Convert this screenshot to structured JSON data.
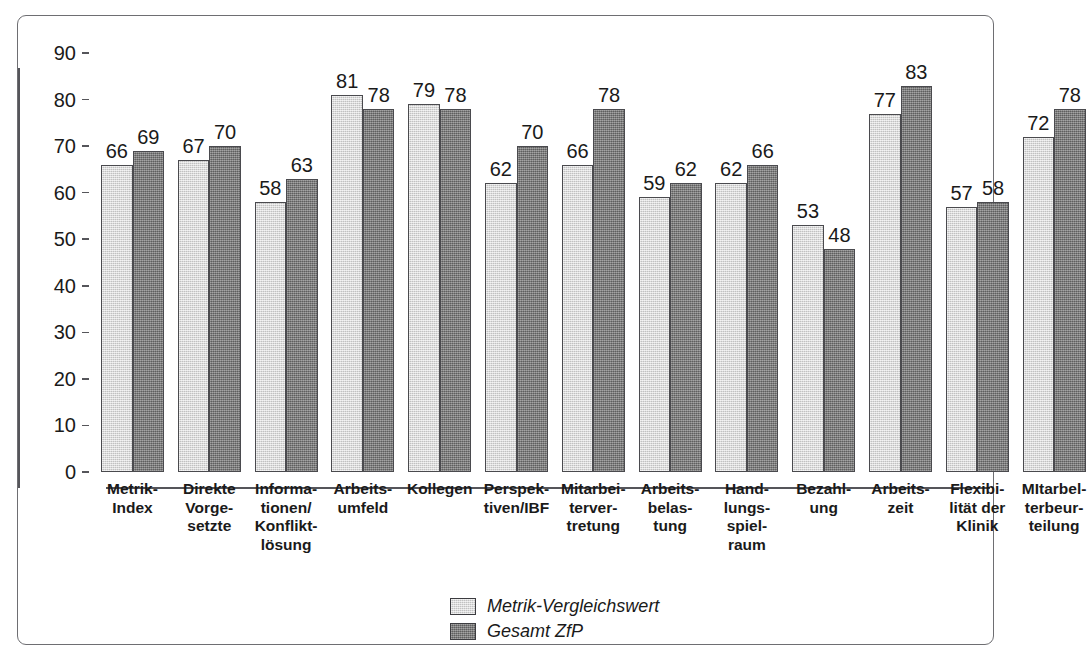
{
  "chart_data": {
    "type": "bar",
    "title": "",
    "xlabel": "",
    "ylabel": "",
    "ylim": [
      0,
      90
    ],
    "yticks": [
      0,
      10,
      20,
      30,
      40,
      50,
      60,
      70,
      80,
      90
    ],
    "grid": false,
    "legend_position": "bottom-center",
    "categories": [
      "Metrik-\nIndex",
      "Direkte\nVorge-\nsetzte",
      "Informa-\ntionen/\nKonflikt-\nlösung",
      "Arbeits-\numfeld",
      "Kollegen",
      "Perspek-\ntiven/IBF",
      "Mitarbei-\nterver-\ntretung",
      "Arbeits-\nbelas-\ntung",
      "Hand-\nlungs-\nspiel-\nraum",
      "Bezahl-\nung",
      "Arbeits-\nzeit",
      "Flexibi-\nlität der\nKlinik",
      "MItarbel-\nterbeur-\nteilung"
    ],
    "series": [
      {
        "name": "Metrik-Vergleichswert",
        "color": "#d2d2d2",
        "values": [
          66,
          67,
          58,
          81,
          79,
          62,
          66,
          59,
          62,
          53,
          77,
          57,
          72
        ]
      },
      {
        "name": "Gesamt ZfP",
        "color": "#7e7e7e",
        "values": [
          69,
          70,
          63,
          78,
          78,
          70,
          78,
          62,
          66,
          48,
          83,
          58,
          78
        ]
      }
    ]
  },
  "legend": {
    "items": [
      {
        "label": "Metrik-Vergleichswert",
        "swatch": "light"
      },
      {
        "label": "Gesamt ZfP",
        "swatch": "dark"
      }
    ]
  },
  "colors": {
    "light_bar": "#d2d2d2",
    "dark_bar": "#7e7e7e",
    "bar_outline": "#4a4a4e",
    "axis": "#55555a",
    "frame": "#6e6e72",
    "background": "#ffffff",
    "text": "#1a1a1a"
  }
}
